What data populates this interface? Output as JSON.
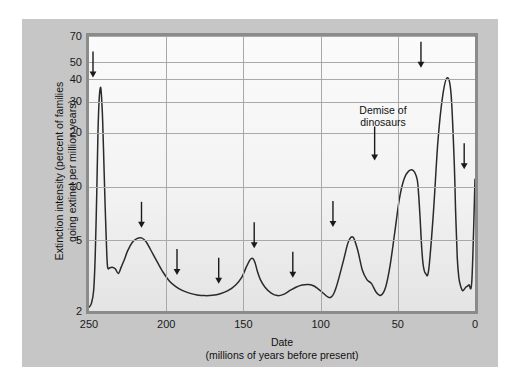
{
  "figure": {
    "background_color": "#ffffff",
    "panel_color": "#c6c6c6",
    "frame_color": "#8b8b8b",
    "curve_color": "#2a2a2a"
  },
  "annotations": [
    {
      "id": "demise-of-dinosaurs",
      "line1": "Demise of",
      "line2": "dinosaurs"
    }
  ],
  "chart_data": {
    "type": "line",
    "title": "",
    "subtitle": "",
    "xlabel": "Date",
    "xlabel_sub": "(millions of years before present)",
    "ylabel": "Extinction intensity (percent of families going extinct per million years)",
    "ylabel_line1": "Extinction intensity (percent of families",
    "ylabel_line2": "going extinct per million years)",
    "xscale": "linear",
    "yscale": "log",
    "xlim": [
      250,
      0
    ],
    "ylim": [
      2,
      70
    ],
    "x_reversed": true,
    "grid": true,
    "legend": "none",
    "xticks": [
      250,
      200,
      150,
      100,
      50,
      0
    ],
    "xtick_labels": [
      "250",
      "200",
      "150",
      "100",
      "50",
      "0"
    ],
    "yticks": [
      2,
      5,
      10,
      20,
      30,
      40,
      50,
      70
    ],
    "ytick_labels": [
      "2",
      "5",
      "10",
      "20",
      "30",
      "40",
      "50",
      "70"
    ],
    "series": [
      {
        "name": "Extinction intensity",
        "x": [
          250.0,
          248.5,
          247.0,
          246.0,
          245.0,
          244.2,
          243.4,
          242.6,
          242.0,
          241.2,
          240.4,
          239.6,
          238.8,
          238.0,
          236.5,
          235.0,
          233.0,
          231.0,
          229.0,
          227.0,
          225.0,
          222.0,
          219.0,
          216.0,
          213.0,
          210.0,
          206.0,
          202.0,
          198.0,
          194.0,
          190.0,
          185.0,
          180.0,
          175.0,
          170.0,
          165.0,
          160.0,
          155.0,
          151.0,
          148.0,
          145.5,
          144.0,
          142.5,
          141.0,
          139.0,
          136.0,
          132.0,
          128.0,
          124.0,
          120.0,
          116.0,
          112.0,
          108.0,
          105.0,
          102.0,
          99.0,
          96.0,
          94.5,
          93.0,
          91.5,
          90.0,
          88.0,
          85.0,
          82.0,
          79.0,
          76.0,
          73.0,
          70.0,
          67.0,
          64.0,
          61.0,
          58.0,
          55.0,
          52.0,
          49.0,
          46.0,
          43.0,
          40.0,
          37.5,
          36.5,
          35.5,
          34.5,
          33.5,
          32.0,
          30.0,
          27.0,
          24.0,
          21.0,
          18.0,
          15.5,
          13.5,
          12.5,
          11.5,
          10.5,
          9.5,
          8.0,
          6.0,
          4.0,
          2.0,
          0.0
        ],
        "y": [
          2.1,
          2.2,
          2.6,
          4.0,
          9.0,
          20.0,
          31.0,
          36.0,
          33.0,
          24.0,
          14.0,
          8.0,
          5.0,
          3.55,
          3.5,
          3.52,
          3.45,
          3.25,
          3.55,
          3.9,
          4.35,
          4.85,
          5.1,
          5.15,
          4.9,
          4.4,
          3.8,
          3.3,
          2.95,
          2.75,
          2.62,
          2.52,
          2.46,
          2.44,
          2.45,
          2.5,
          2.6,
          2.8,
          3.1,
          3.55,
          3.9,
          3.95,
          3.75,
          3.35,
          3.0,
          2.72,
          2.52,
          2.44,
          2.48,
          2.6,
          2.72,
          2.8,
          2.82,
          2.78,
          2.68,
          2.55,
          2.42,
          2.38,
          2.4,
          2.5,
          2.7,
          3.1,
          3.9,
          4.9,
          5.2,
          4.4,
          3.4,
          3.0,
          2.85,
          2.55,
          2.45,
          2.7,
          3.6,
          5.5,
          8.5,
          11.0,
          12.2,
          12.3,
          11.0,
          9.0,
          6.5,
          4.5,
          3.6,
          3.25,
          3.4,
          7.0,
          18.0,
          32.0,
          40.8,
          33.0,
          14.0,
          7.0,
          4.0,
          3.1,
          2.8,
          2.6,
          2.72,
          2.8,
          3.0,
          11.0
        ]
      }
    ],
    "event_markers": [
      {
        "label": "",
        "x": 250.0,
        "peak_value": 36.0
      },
      {
        "label": "",
        "x": 216.0,
        "peak_value": 5.15
      },
      {
        "label": "",
        "x": 193.0,
        "peak_value": 2.8
      },
      {
        "label": "",
        "x": 166.0,
        "peak_value": 2.5
      },
      {
        "label": "",
        "x": 143.0,
        "peak_value": 3.95
      },
      {
        "label": "",
        "x": 118.0,
        "peak_value": 2.7
      },
      {
        "label": "",
        "x": 92.0,
        "peak_value": 5.2
      },
      {
        "label": "Demise of dinosaurs",
        "x": 65.0,
        "peak_value": 12.3
      },
      {
        "label": "",
        "x": 35.0,
        "peak_value": 40.8
      },
      {
        "label": "",
        "x": 7.0,
        "peak_value": 11.0
      }
    ]
  }
}
